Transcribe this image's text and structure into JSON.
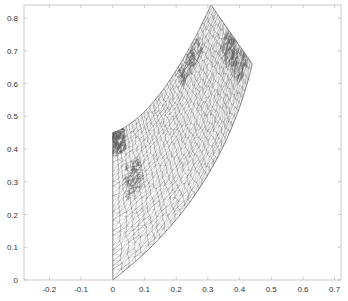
{
  "chart_data": {
    "type": "mesh",
    "title": "",
    "xlabel": "",
    "ylabel": "",
    "xlim": [
      -0.28,
      0.72
    ],
    "ylim": [
      0,
      0.84
    ],
    "grid": false,
    "box": true,
    "x_ticks": [
      -0.2,
      -0.1,
      0,
      0.1,
      0.2,
      0.3,
      0.4,
      0.5,
      0.6,
      0.7
    ],
    "x_tick_labels": [
      "-0.2",
      "-0.1",
      "0",
      "0.1",
      "0.2",
      "0.3",
      "0.4",
      "0.5",
      "0.6",
      "0.7"
    ],
    "y_ticks": [
      0,
      0.1,
      0.2,
      0.3,
      0.4,
      0.5,
      0.6,
      0.7,
      0.8
    ],
    "y_tick_labels": [
      "0",
      "0.1",
      "0.2",
      "0.3",
      "0.4",
      "0.5",
      "0.6",
      "0.7",
      "0.8"
    ],
    "domain_vertices": [
      {
        "name": "bottom",
        "x": 0.0,
        "y": 0.0
      },
      {
        "name": "left-top",
        "x": 0.0,
        "y": 0.45
      },
      {
        "name": "top",
        "x": 0.31,
        "y": 0.84
      },
      {
        "name": "right",
        "x": 0.44,
        "y": 0.66
      }
    ],
    "edges": [
      {
        "from": "bottom",
        "to": "left-top",
        "shape": "straight"
      },
      {
        "from": "left-top",
        "to": "top",
        "shape": "concave-curve",
        "mid": {
          "x": 0.15,
          "y": 0.57
        }
      },
      {
        "from": "top",
        "to": "right",
        "shape": "straight"
      },
      {
        "from": "right",
        "to": "bottom",
        "shape": "concave-curve",
        "mid": {
          "x": 0.28,
          "y": 0.29
        }
      }
    ],
    "mesh_color": "#6f6f6f"
  }
}
